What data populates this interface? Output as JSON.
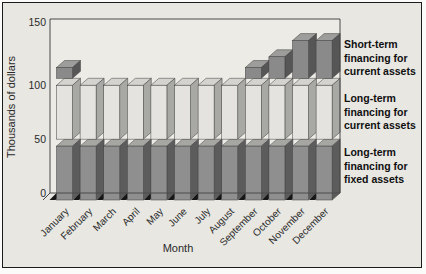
{
  "chart_data": {
    "type": "bar",
    "variant": "3d-stacked-vertical",
    "title": "",
    "xlabel": "Month",
    "ylabel": "Thousands of dollars",
    "ylim": [
      0,
      150
    ],
    "yticks": [
      0,
      50,
      100,
      150
    ],
    "grid": false,
    "categories": [
      "January",
      "February",
      "March",
      "April",
      "May",
      "June",
      "July",
      "August",
      "September",
      "October",
      "November",
      "December"
    ],
    "series": [
      {
        "name": "Long-term financing for fixed assets",
        "stack_position": "bottom",
        "values": [
          50,
          50,
          50,
          50,
          50,
          50,
          50,
          50,
          50,
          50,
          50,
          50
        ],
        "color": {
          "front": "#8f8f8f",
          "side": "#5c5c5c",
          "top": "#a6a6a3"
        }
      },
      {
        "name": "Long-term financing for current assets",
        "stack_position": "middle",
        "values": [
          50,
          50,
          50,
          50,
          50,
          50,
          50,
          50,
          50,
          50,
          50,
          50
        ],
        "color": {
          "front": "#e4e3df",
          "side": "#a8a8a5",
          "top": "#d4d3cf"
        }
      },
      {
        "name": "Short-term financing for current assets",
        "stack_position": "top",
        "values": [
          10,
          0,
          0,
          0,
          0,
          0,
          0,
          0,
          10,
          20,
          35,
          35
        ],
        "color": {
          "front": "#8a8a8a",
          "side": "#565656",
          "top": "#9d9d9b"
        }
      }
    ],
    "legend": {
      "position": "right",
      "items": [
        {
          "lines": [
            "Short-term",
            "financing for",
            "current assets"
          ]
        },
        {
          "lines": [
            "Long-term",
            "financing for",
            "current assets"
          ]
        },
        {
          "lines": [
            "Long-term",
            "financing for",
            "fixed assets"
          ]
        }
      ]
    },
    "colors": {
      "figure_background": "#e8e7e2",
      "plot_background": "#ecebe6",
      "frame_line": "#4a4a4a",
      "pedestal": "#161616",
      "text": "#2a2a2a"
    }
  }
}
